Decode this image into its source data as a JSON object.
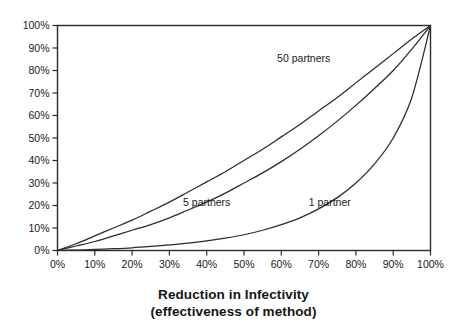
{
  "chart_data": {
    "type": "line",
    "title": "",
    "xlabel": "Reduction in Infectivity",
    "xlabel_line2": "(effectiveness of method)",
    "ylabel": "",
    "xlim": [
      0,
      100
    ],
    "ylim": [
      0,
      100
    ],
    "grid": false,
    "legend_position": "inline-annotations",
    "x_tick_labels": [
      "0%",
      "10%",
      "20%",
      "30%",
      "40%",
      "50%",
      "60%",
      "70%",
      "80%",
      "90%",
      "100%"
    ],
    "y_tick_labels": [
      "0%",
      "10%",
      "20%",
      "30%",
      "40%",
      "50%",
      "60%",
      "70%",
      "80%",
      "90%",
      "100%"
    ],
    "x_ticks": [
      0,
      10,
      20,
      30,
      40,
      50,
      60,
      70,
      80,
      90,
      100
    ],
    "y_ticks": [
      0,
      10,
      20,
      30,
      40,
      50,
      60,
      70,
      80,
      90,
      100
    ],
    "x": [
      0,
      5,
      10,
      15,
      20,
      25,
      30,
      35,
      40,
      45,
      50,
      55,
      60,
      65,
      70,
      75,
      80,
      85,
      90,
      95,
      100
    ],
    "series": [
      {
        "name": "50 partners",
        "label": "50 partners",
        "color": "#2b2b2b",
        "values": [
          0,
          3,
          6.5,
          10,
          13.5,
          17.5,
          21.5,
          26,
          30.5,
          35,
          40,
          45,
          50.5,
          56,
          62,
          68,
          74.5,
          81,
          87.5,
          94,
          100
        ]
      },
      {
        "name": "5 partners",
        "label": "5 partners",
        "color": "#2b2b2b",
        "values": [
          0,
          2,
          4,
          6.5,
          9,
          11.5,
          14.5,
          18,
          21.5,
          25.5,
          30,
          34.5,
          39.5,
          45,
          51,
          57.5,
          64.5,
          72,
          80,
          89.5,
          100
        ]
      },
      {
        "name": "1 partner",
        "label": "1 partner",
        "color": "#2b2b2b",
        "values": [
          0,
          0.2,
          0.5,
          0.8,
          1.2,
          1.8,
          2.5,
          3.3,
          4.3,
          5.5,
          7,
          9,
          11.5,
          14.5,
          18.5,
          23.5,
          30,
          38.5,
          50,
          68,
          100
        ]
      }
    ],
    "annotations": [
      {
        "text": "50 partners",
        "x": 66,
        "y": 84
      },
      {
        "text": "5 partners",
        "x": 40,
        "y": 20
      },
      {
        "text": "1 partner",
        "x": 73,
        "y": 20
      }
    ]
  }
}
